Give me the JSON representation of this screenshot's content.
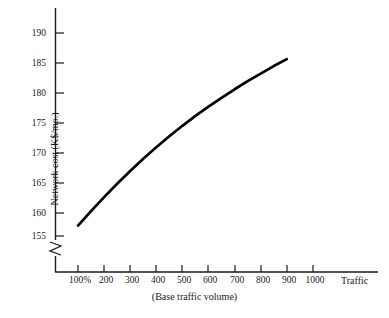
{
  "chart_data": {
    "type": "line",
    "title": "",
    "subtitle": "",
    "xlabel": "(Base traffic volume)",
    "ylabel": "Network cost (K$/mo.)",
    "x_end_label": "Traffic",
    "grid": false,
    "legend": null,
    "axis_break": {
      "axis": "y",
      "present": true,
      "style": "zigzag",
      "note": "y-axis broken below 155"
    },
    "xlim": [
      100,
      1050
    ],
    "ylim": [
      153.5,
      192
    ],
    "x_tick_labels": [
      "100%",
      "200",
      "300",
      "400",
      "500",
      "600",
      "700",
      "800",
      "900",
      "1000"
    ],
    "x_ticks": [
      100,
      200,
      300,
      400,
      500,
      600,
      700,
      800,
      900,
      1000
    ],
    "y_tick_labels": [
      "155",
      "160",
      "165",
      "170",
      "175",
      "180",
      "185",
      "190"
    ],
    "y_ticks": [
      155,
      160,
      165,
      170,
      175,
      180,
      185,
      190
    ],
    "series": [
      {
        "name": "Network cost",
        "x": [
          100,
          150,
          200,
          250,
          300,
          350,
          400,
          450,
          500,
          550,
          600,
          650,
          700,
          750,
          800,
          850,
          900
        ],
        "values": [
          156.8,
          159.3,
          161.7,
          164.0,
          166.2,
          168.3,
          170.3,
          172.2,
          174.0,
          175.7,
          177.3,
          178.8,
          180.3,
          181.7,
          183.0,
          184.3,
          185.5
        ]
      }
    ]
  }
}
